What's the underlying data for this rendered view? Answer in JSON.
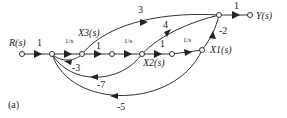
{
  "figure_label": "(a)",
  "nodes": {
    "input": "R(s)",
    "x3": "X3(s)",
    "x2": "X2(s)",
    "x1": "X1(s)",
    "output": "Y(s)"
  },
  "gains": {
    "r_to_n1": "1",
    "n1_to_x3": "1/s",
    "x3_to_n2": "1",
    "n2_to_x2": "1/s",
    "x2_to_n3": "1",
    "n3_to_x1": "1/s",
    "x1_to_out": "-2",
    "out_to_y": "1",
    "x3_to_out": "3",
    "x2_to_out": "4",
    "fb_x3": "-3",
    "fb_x2": "-7",
    "fb_x1": "-5"
  }
}
